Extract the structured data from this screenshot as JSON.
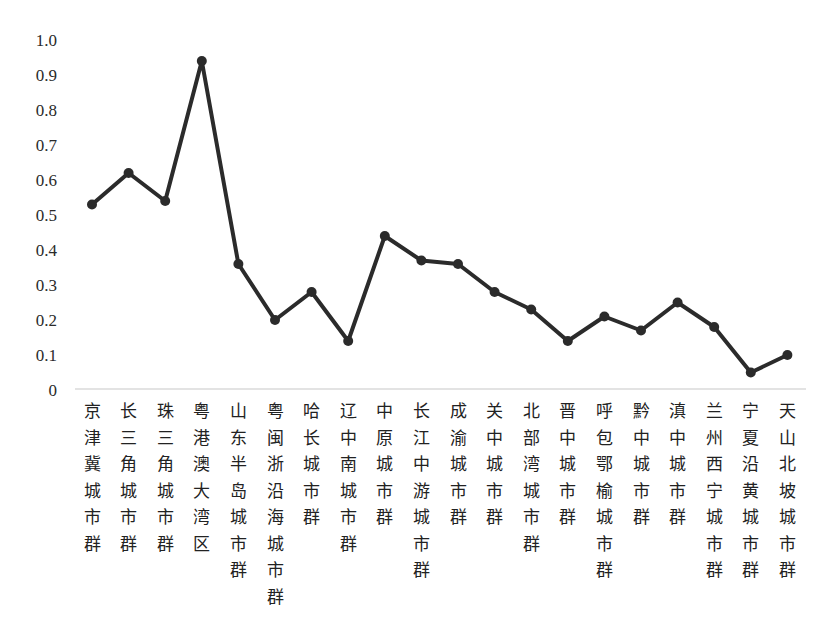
{
  "chart_data": {
    "type": "line",
    "title": "",
    "xlabel": "",
    "ylabel": "",
    "ylim": [
      0,
      1.0
    ],
    "yticks": [
      "0",
      "0.1",
      "0.2",
      "0.3",
      "0.4",
      "0.5",
      "0.6",
      "0.7",
      "0.8",
      "0.9",
      "1.0"
    ],
    "grid": false,
    "legend": null,
    "line_color": "#2b2b2b",
    "marker": "circle",
    "categories": [
      "京津冀城市群",
      "长三角城市群",
      "珠三角城市群",
      "粤港澳大湾区",
      "山东半岛城市群",
      "粤闽浙沿海城市群",
      "哈长城市群",
      "辽中南城市群",
      "中原城市群",
      "长江中游城市群",
      "成渝城市群",
      "关中城市群",
      "北部湾城市群",
      "晋中城市群",
      "呼包鄂榆城市群",
      "黔中城市群",
      "滇中城市群",
      "兰州西宁城市群",
      "宁夏沿黄城市群",
      "天山北坡城市群"
    ],
    "values": [
      0.53,
      0.62,
      0.54,
      0.94,
      0.36,
      0.2,
      0.28,
      0.14,
      0.44,
      0.37,
      0.36,
      0.28,
      0.23,
      0.14,
      0.21,
      0.17,
      0.25,
      0.18,
      0.05,
      0.1
    ]
  }
}
